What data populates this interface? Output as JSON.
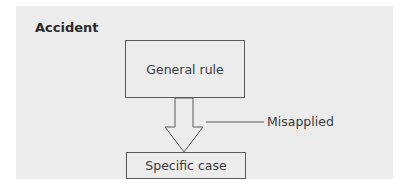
{
  "diagram": {
    "title": "Accident",
    "nodes": [
      {
        "id": "general",
        "label": "General rule"
      },
      {
        "id": "specific",
        "label": "Specific case"
      }
    ],
    "edge": {
      "from": "general",
      "to": "specific",
      "style": "hollow-block-arrow"
    },
    "annotation": {
      "label": "Misapplied",
      "target": "edge"
    }
  },
  "colors": {
    "panel": "#ececec",
    "stroke": "#5a5a5a",
    "text": "#3a3a3a"
  }
}
